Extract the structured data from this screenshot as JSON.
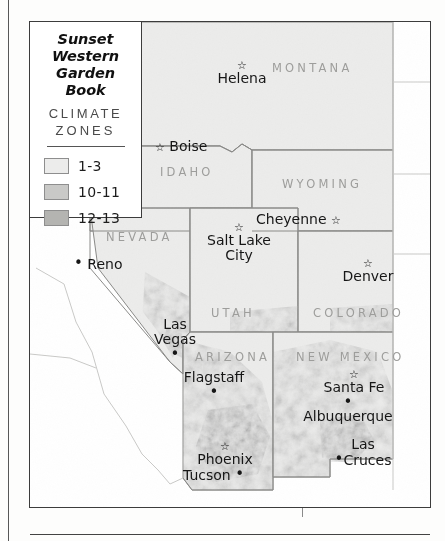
{
  "document": {
    "map_title_line1": "Sunset",
    "map_title_line2": "Western",
    "map_title_line3": "Garden Book"
  },
  "legend": {
    "heading_line1": "CLIMATE",
    "heading_line2": "ZONES",
    "rows": [
      {
        "label": "1-3",
        "color": "#ececeb",
        "swatch_name": "zone-1-3"
      },
      {
        "label": "10-11",
        "color": "#c9c9c7",
        "swatch_name": "zone-10-11"
      },
      {
        "label": "12-13",
        "color": "#b4b4b1",
        "swatch_name": "zone-12-13"
      }
    ]
  },
  "map": {
    "states": [
      {
        "name": "MONTANA"
      },
      {
        "name": "IDAHO"
      },
      {
        "name": "WYOMING"
      },
      {
        "name": "NEVADA"
      },
      {
        "name": "UTAH"
      },
      {
        "name": "COLORADO"
      },
      {
        "name": "ARIZONA"
      },
      {
        "name": "NEW MEXICO"
      }
    ],
    "cities": [
      {
        "name": "Helena",
        "marker": "star",
        "marker_position": "above"
      },
      {
        "name": "Boise",
        "marker": "star",
        "marker_position": "left"
      },
      {
        "name": "Cheyenne",
        "marker": "star",
        "marker_position": "right"
      },
      {
        "name": "Salt Lake City",
        "line1": "Salt Lake",
        "line2": "City",
        "marker": "star",
        "marker_position": "above"
      },
      {
        "name": "Denver",
        "marker": "star",
        "marker_position": "above"
      },
      {
        "name": "Reno",
        "marker": "dot",
        "marker_position": "left"
      },
      {
        "name": "Las Vegas",
        "line1": "Las",
        "line2": "Vegas",
        "marker": "dot",
        "marker_position": "below"
      },
      {
        "name": "Flagstaff",
        "marker": "dot",
        "marker_position": "below"
      },
      {
        "name": "Phoenix",
        "marker": "star",
        "marker_position": "above"
      },
      {
        "name": "Tucson",
        "marker": "dot",
        "marker_position": "right"
      },
      {
        "name": "Santa Fe",
        "marker": "star",
        "marker_position": "above"
      },
      {
        "name": "Albuquerque",
        "marker": "dot",
        "marker_position": "above"
      },
      {
        "name": "Las Cruces",
        "line1": "Las",
        "line2": "Cruces",
        "marker": "dot",
        "marker_position": "left-second-line"
      }
    ],
    "glyphs": {
      "star": "☆",
      "dot": "•"
    },
    "colors": {
      "zone_light": "#ececeb",
      "zone_mid": "#c9c9c7",
      "zone_dark": "#b4b4b1",
      "border": "#8a8a88",
      "frame": "#3c3c3c",
      "state_label": "#9d9d9b",
      "city_label": "#161616",
      "page": "#ffffff"
    }
  }
}
